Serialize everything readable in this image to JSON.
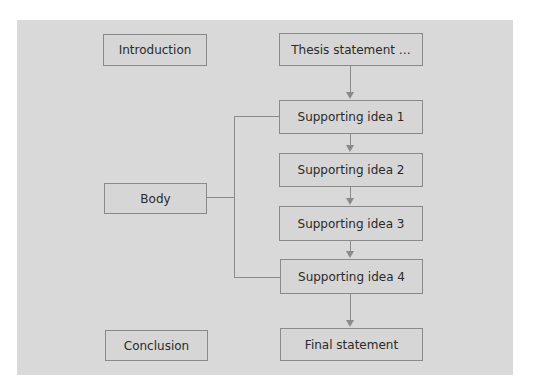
{
  "diagram": {
    "type": "essay-structure-flowchart",
    "colors": {
      "background": "#ffffff",
      "panel": "#d9d9d9",
      "box_fill": "#d6d6d6",
      "box_border": "#8a8a8a",
      "text": "#2a2a2a"
    },
    "sections": {
      "introduction": "Introduction",
      "body": "Body",
      "conclusion": "Conclusion"
    },
    "flow": {
      "thesis": "Thesis statement …",
      "supporting": [
        "Supporting idea 1",
        "Supporting idea 2",
        "Supporting idea 3",
        "Supporting idea 4"
      ],
      "final": "Final statement"
    },
    "connections": [
      {
        "from": "Thesis statement …",
        "to": "Supporting idea 1",
        "type": "arrow"
      },
      {
        "from": "Supporting idea 1",
        "to": "Supporting idea 2",
        "type": "arrow"
      },
      {
        "from": "Supporting idea 2",
        "to": "Supporting idea 3",
        "type": "arrow"
      },
      {
        "from": "Supporting idea 3",
        "to": "Supporting idea 4",
        "type": "arrow"
      },
      {
        "from": "Supporting idea 4",
        "to": "Final statement",
        "type": "arrow"
      },
      {
        "from": "Body",
        "to": [
          "Supporting idea 1",
          "Supporting idea 2",
          "Supporting idea 3",
          "Supporting idea 4"
        ],
        "type": "bracket"
      }
    ]
  }
}
